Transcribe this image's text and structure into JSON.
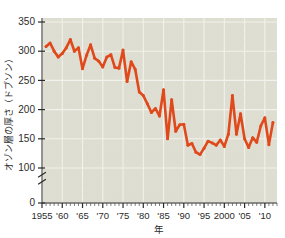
{
  "figure": {
    "top_caption": "",
    "background_color": "#ffffff",
    "plot_background_color": "#dcdcd0"
  },
  "chart_data": {
    "type": "line",
    "title": "",
    "xlabel": "年",
    "ylabel": "オゾン層の厚さ（ドブソン）",
    "xlim": [
      1955,
      2013
    ],
    "ylim": [
      0,
      360
    ],
    "y_axis_break": true,
    "y_axis_break_between": [
      0,
      100
    ],
    "grid": true,
    "legend": false,
    "line_color": "#e0491b",
    "marker_color": "#e0491b",
    "yticks": [
      0,
      100,
      150,
      200,
      250,
      300,
      350
    ],
    "ytick_labels": [
      "0",
      "100",
      "150",
      "200",
      "250",
      "300",
      "350"
    ],
    "xticks": [
      1955,
      1960,
      1965,
      1970,
      1975,
      1980,
      1985,
      1990,
      1995,
      2000,
      2005,
      2010
    ],
    "xtick_labels": [
      "1955",
      "'60",
      "'65",
      "'70",
      "'75",
      "'80",
      "'85",
      "'90",
      "'95",
      "2000",
      "'05",
      "'10"
    ],
    "x": [
      1956,
      1957,
      1958,
      1959,
      1960,
      1961,
      1962,
      1963,
      1964,
      1965,
      1966,
      1967,
      1968,
      1969,
      1970,
      1971,
      1972,
      1973,
      1974,
      1975,
      1976,
      1977,
      1978,
      1979,
      1980,
      1981,
      1982,
      1983,
      1984,
      1985,
      1986,
      1987,
      1988,
      1989,
      1990,
      1991,
      1992,
      1993,
      1994,
      1995,
      1996,
      1997,
      1998,
      1999,
      2000,
      2001,
      2002,
      2003,
      2004,
      2005,
      2006,
      2007,
      2008,
      2009,
      2010,
      2011,
      2012
    ],
    "values": [
      308,
      314,
      300,
      290,
      296,
      306,
      320,
      300,
      306,
      270,
      293,
      311,
      288,
      283,
      273,
      290,
      294,
      272,
      271,
      302,
      248,
      282,
      269,
      230,
      224,
      210,
      195,
      202,
      189,
      234,
      150,
      217,
      163,
      174,
      175,
      139,
      142,
      127,
      123,
      134,
      146,
      143,
      139,
      148,
      137,
      158,
      224,
      158,
      193,
      150,
      135,
      152,
      144,
      172,
      186,
      140,
      178
    ],
    "units": "ドブソン"
  }
}
